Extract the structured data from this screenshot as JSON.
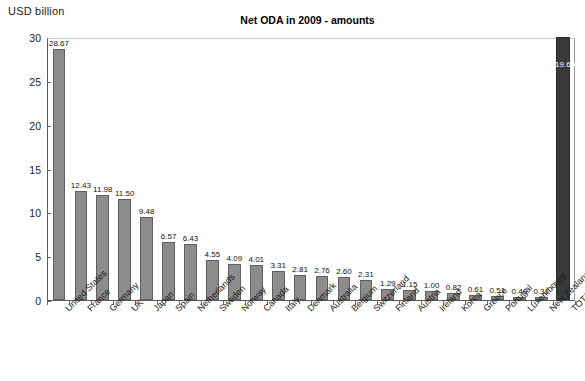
{
  "axis_unit_label": "USD billion",
  "chart_data": {
    "type": "bar",
    "title": "Net ODA in 2009 - amounts",
    "xlabel": "",
    "ylabel": "USD billion",
    "ylim": [
      0,
      30
    ],
    "yticks": [
      0,
      5,
      10,
      15,
      20,
      25,
      30
    ],
    "grid": false,
    "legend": "none",
    "note": "Final category TOTAL DAC is drawn as a full-height dark bar with its value 119.60 labelled inside; it exceeds the 0-30 axis range.",
    "colors": {
      "bar": "#8c8c8c",
      "bar_border": "#5f5f5f",
      "total_bar": "#3a3a3a",
      "axis": "#5a5a5a",
      "text": "#1a1a1a"
    },
    "categories": [
      "United States",
      "France",
      "Germany",
      "UK",
      "Japan",
      "Spain",
      "Netherlands",
      "Sweden",
      "Norway",
      "Canada",
      "Italy",
      "Denmark",
      "Australia",
      "Belgium",
      "Switzerland",
      "Finland",
      "Austria",
      "Ireland",
      "Korea",
      "Greece",
      "Portugal",
      "Luxembourg",
      "New Zealand",
      "TOTAL DAC"
    ],
    "values": [
      28.67,
      12.43,
      11.98,
      11.5,
      9.48,
      6.57,
      6.43,
      4.55,
      4.09,
      4.01,
      3.31,
      2.81,
      2.76,
      2.6,
      2.31,
      1.29,
      1.15,
      1.0,
      0.82,
      0.61,
      0.51,
      0.4,
      0.31,
      119.6
    ],
    "value_labels": [
      "28.67",
      "12.43",
      "11.98",
      "11.50",
      "9.48",
      "6.57",
      "6.43",
      "4.55",
      "4.09",
      "4.01",
      "3.31",
      "2.81",
      "2.76",
      "2.60",
      "2.31",
      "1.29",
      "1.15",
      "1.00",
      "0.82",
      "0.61",
      "0.51",
      "0.40",
      "0.31",
      "119.60"
    ]
  }
}
